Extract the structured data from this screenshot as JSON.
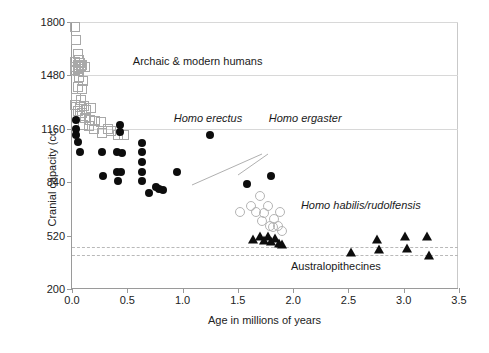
{
  "chart_data": {
    "type": "scatter",
    "title": "",
    "xlabel": "Age in millions of years",
    "ylabel": "Cranial capacity (cc;",
    "xlim": [
      0.0,
      3.5
    ],
    "ylim": [
      200,
      1800
    ],
    "xticks": [
      "0.0",
      "0.5",
      "1.0",
      "1.5",
      "2.0",
      "2.5",
      "3.0",
      "3.5"
    ],
    "xtick_values": [
      0.0,
      0.5,
      1.0,
      1.5,
      2.0,
      2.5,
      3.0,
      3.5
    ],
    "yticks": [
      "200",
      "520",
      "840",
      "1160",
      "1480",
      "1800"
    ],
    "ytick_values": [
      200,
      520,
      840,
      1160,
      1480,
      1800
    ],
    "grid": "horizontal-light",
    "gridline_values": [
      1160,
      1480,
      1800
    ],
    "dashed_reference_lines": [
      450,
      405
    ],
    "legend": "none (in-plot annotations)",
    "annotations": [
      {
        "text": "Archaic & modern humans",
        "x": 0.55,
        "y": 1560,
        "style": "normal"
      },
      {
        "text": "Homo erectus",
        "x": 0.92,
        "y": 1220,
        "style": "italic"
      },
      {
        "text": "Homo ergaster",
        "x": 1.78,
        "y": 1220,
        "style": "italic"
      },
      {
        "text": "Homo habilis/rudolfensis",
        "x": 2.07,
        "y": 700,
        "style": "italic"
      },
      {
        "text": "Australopithecines",
        "x": 1.98,
        "y": 330,
        "style": "normal"
      }
    ],
    "series": [
      {
        "name": "Archaic & modern humans",
        "marker": "square-open",
        "points": [
          [
            0.03,
            1770
          ],
          [
            0.04,
            1690
          ],
          [
            0.05,
            1610
          ],
          [
            0.06,
            1575
          ],
          [
            0.03,
            1560
          ],
          [
            0.05,
            1545
          ],
          [
            0.07,
            1555
          ],
          [
            0.04,
            1530
          ],
          [
            0.06,
            1520
          ],
          [
            0.08,
            1535
          ],
          [
            0.03,
            1515
          ],
          [
            0.05,
            1505
          ],
          [
            0.09,
            1545
          ],
          [
            0.12,
            1530
          ],
          [
            0.06,
            1470
          ],
          [
            0.1,
            1445
          ],
          [
            0.05,
            1410
          ],
          [
            0.09,
            1400
          ],
          [
            0.04,
            1345
          ],
          [
            0.08,
            1335
          ],
          [
            0.03,
            1300
          ],
          [
            0.07,
            1290
          ],
          [
            0.11,
            1295
          ],
          [
            0.05,
            1265
          ],
          [
            0.09,
            1255
          ],
          [
            0.13,
            1270
          ],
          [
            0.17,
            1285
          ],
          [
            0.07,
            1235
          ],
          [
            0.12,
            1225
          ],
          [
            0.16,
            1215
          ],
          [
            0.21,
            1205
          ],
          [
            0.1,
            1185
          ],
          [
            0.15,
            1175
          ],
          [
            0.26,
            1200
          ],
          [
            0.2,
            1160
          ],
          [
            0.33,
            1160
          ],
          [
            0.27,
            1135
          ],
          [
            0.35,
            1145
          ],
          [
            0.42,
            1125
          ],
          [
            0.47,
            1120
          ]
        ]
      },
      {
        "name": "Homo erectus / Homo ergaster",
        "marker": "circle-filled",
        "points": [
          [
            0.04,
            1210
          ],
          [
            0.04,
            1160
          ],
          [
            0.04,
            1120
          ],
          [
            0.05,
            1080
          ],
          [
            0.07,
            1020
          ],
          [
            0.27,
            1020
          ],
          [
            0.28,
            880
          ],
          [
            0.41,
            1020
          ],
          [
            0.41,
            900
          ],
          [
            0.42,
            845
          ],
          [
            0.43,
            1180
          ],
          [
            0.43,
            1140
          ],
          [
            0.45,
            1015
          ],
          [
            0.44,
            900
          ],
          [
            0.63,
            1075
          ],
          [
            0.63,
            1020
          ],
          [
            0.63,
            960
          ],
          [
            0.63,
            900
          ],
          [
            0.63,
            845
          ],
          [
            0.7,
            775
          ],
          [
            0.76,
            810
          ],
          [
            0.79,
            800
          ],
          [
            0.82,
            795
          ],
          [
            0.95,
            900
          ],
          [
            1.25,
            1120
          ],
          [
            1.58,
            830
          ],
          [
            1.8,
            880
          ]
        ]
      },
      {
        "name": "Homo habilis/rudolfensis",
        "marker": "circle-open",
        "points": [
          [
            1.52,
            660
          ],
          [
            1.62,
            700
          ],
          [
            1.66,
            660
          ],
          [
            1.7,
            760
          ],
          [
            1.72,
            610
          ],
          [
            1.74,
            655
          ],
          [
            1.77,
            700
          ],
          [
            1.79,
            580
          ],
          [
            1.82,
            570
          ],
          [
            1.83,
            620
          ],
          [
            1.86,
            575
          ],
          [
            1.88,
            660
          ],
          [
            1.9,
            545
          ]
        ]
      },
      {
        "name": "Australopithecines",
        "marker": "triangle",
        "points": [
          [
            1.64,
            500
          ],
          [
            1.7,
            520
          ],
          [
            1.74,
            495
          ],
          [
            1.77,
            515
          ],
          [
            1.8,
            490
          ],
          [
            1.84,
            505
          ],
          [
            1.87,
            475
          ],
          [
            1.9,
            470
          ],
          [
            2.52,
            420
          ],
          [
            2.76,
            500
          ],
          [
            2.78,
            440
          ],
          [
            3.01,
            520
          ],
          [
            3.03,
            445
          ],
          [
            3.21,
            520
          ],
          [
            3.23,
            405
          ]
        ]
      }
    ]
  },
  "labels": {
    "archaic": "Archaic & modern humans",
    "erectus": "Homo erectus",
    "ergaster": "Homo ergaster",
    "habilis": "Homo habilis/rudolfensis",
    "australo": "Australopithecines"
  }
}
